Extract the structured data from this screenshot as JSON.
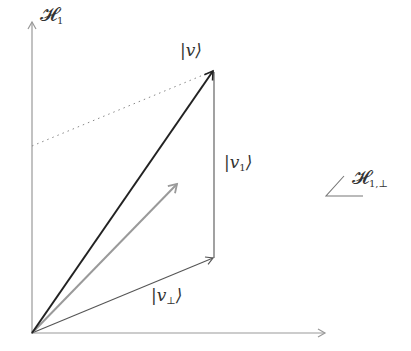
{
  "diagram": {
    "type": "vector-decomposition",
    "colors": {
      "axis": "#999999",
      "vector_v": "#222222",
      "vector_gray": "#9a9a9a",
      "components": "#555555",
      "dotted": "#888888"
    },
    "points": {
      "origin": [
        32,
        333
      ],
      "v_tip": [
        214,
        70
      ],
      "corner": [
        214,
        258
      ],
      "gray_tip": [
        178,
        183
      ],
      "y_axis_top": [
        32,
        20
      ],
      "x_axis_right": [
        326,
        333
      ],
      "dotted_start": [
        32,
        146
      ]
    },
    "labels": {
      "h1": {
        "main": "𝓗",
        "sub": "1"
      },
      "v": "|v⟩",
      "v1": {
        "pre": "|v",
        "sub": "1",
        "post": "⟩"
      },
      "vperp": {
        "pre": "|v",
        "sub": "⊥",
        "post": "⟩"
      },
      "h1perp": {
        "main": "𝓗",
        "sub": "1,⊥"
      }
    }
  }
}
